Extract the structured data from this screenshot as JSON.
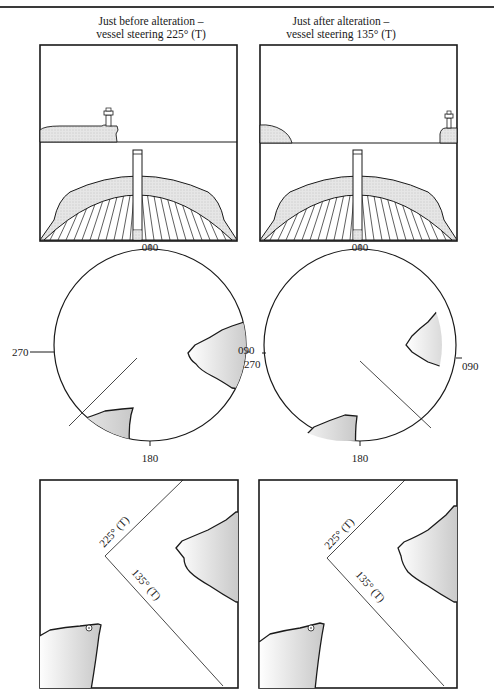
{
  "header": {
    "running_title": ""
  },
  "panels": {
    "before": {
      "caption_line1": "Just before alteration –",
      "caption_line2": "vessel steering 225° (T)"
    },
    "after": {
      "caption_line1": "Just after alteration –",
      "caption_line2": "vessel steering 135° (T)"
    }
  },
  "compass": {
    "north": "000",
    "east": "090",
    "south": "180",
    "west": "270"
  },
  "chart": {
    "course_before": "225° (T)",
    "course_after": "135° (T)"
  },
  "colors": {
    "ink": "#1a1a1a",
    "land_fill": "#d9d9d9",
    "land_shadow": "#bdbdbd",
    "paper": "#ffffff"
  }
}
